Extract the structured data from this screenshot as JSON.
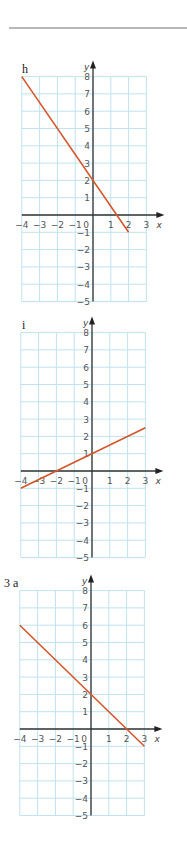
{
  "page": {
    "rule_color": "#b8b8b8"
  },
  "chart_data": [
    {
      "type": "line",
      "label": "h",
      "title": "h",
      "xlabel": "x",
      "ylabel": "y",
      "xlim": [
        -4,
        3
      ],
      "ylim": [
        -5,
        8
      ],
      "x_ticks": [
        "-4",
        "-3",
        "-2",
        "-1",
        "0",
        "1",
        "2",
        "3"
      ],
      "y_ticks": [
        "8",
        "7",
        "6",
        "5",
        "4",
        "3",
        "2",
        "1",
        "-1",
        "-2",
        "-3",
        "-4",
        "-5"
      ],
      "grid": true,
      "series": [
        {
          "name": "line h",
          "x": [
            -4,
            2
          ],
          "y": [
            8,
            -1
          ],
          "color": "#d4562a"
        }
      ],
      "origin_px": [
        93,
        215
      ]
    },
    {
      "type": "line",
      "label": "i",
      "title": "i",
      "xlabel": "x",
      "ylabel": "y",
      "xlim": [
        -4,
        3
      ],
      "ylim": [
        -5,
        8
      ],
      "x_ticks": [
        "-4",
        "-3",
        "-2",
        "-1",
        "0",
        "1",
        "2",
        "3"
      ],
      "y_ticks": [
        "8",
        "7",
        "6",
        "5",
        "4",
        "3",
        "2",
        "1",
        "-1",
        "-2",
        "-3",
        "-4",
        "-5"
      ],
      "grid": true,
      "series": [
        {
          "name": "line i",
          "x": [
            -4,
            3
          ],
          "y": [
            -1,
            2.5
          ],
          "color": "#d4562a"
        }
      ],
      "origin_px": [
        92,
        471
      ]
    },
    {
      "type": "line",
      "label": "3 a",
      "title": "3 a",
      "xlabel": "x",
      "ylabel": "y",
      "xlim": [
        -4,
        3
      ],
      "ylim": [
        -5,
        8
      ],
      "x_ticks": [
        "-4",
        "-3",
        "-2",
        "-1",
        "0",
        "1",
        "2",
        "3"
      ],
      "y_ticks": [
        "8",
        "7",
        "6",
        "5",
        "4",
        "3",
        "2",
        "1",
        "-1",
        "-2",
        "-3",
        "-4",
        "-5"
      ],
      "grid": true,
      "series": [
        {
          "name": "line 3a",
          "x": [
            -4,
            3
          ],
          "y": [
            6,
            -1
          ],
          "color": "#d4562a"
        }
      ],
      "origin_px": [
        91,
        729
      ]
    }
  ]
}
